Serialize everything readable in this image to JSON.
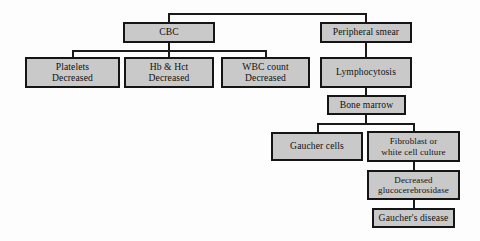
{
  "diagram": {
    "colors": {
      "box_fill": "#c9c9c9",
      "box_border": "#151515",
      "line": "#1a1a1a",
      "background": "#fdfdfd",
      "text": "#111111"
    },
    "nodes": [
      {
        "id": "cbc",
        "lines": [
          "CBC"
        ]
      },
      {
        "id": "peripheral",
        "lines": [
          "Peripheral smear"
        ]
      },
      {
        "id": "platelets",
        "lines": [
          "Platelets",
          "Decreased"
        ]
      },
      {
        "id": "hbhct",
        "lines": [
          "Hb & Hct",
          "Decreased"
        ]
      },
      {
        "id": "wbc",
        "lines": [
          "WBC count",
          "Decreased"
        ]
      },
      {
        "id": "lymphocytosis",
        "lines": [
          "Lymphocytosis"
        ]
      },
      {
        "id": "bonemarrow",
        "lines": [
          "Bone marrow"
        ]
      },
      {
        "id": "gauchercells",
        "lines": [
          "Gaucher cells"
        ]
      },
      {
        "id": "fibroblast",
        "lines": [
          "Fibroblast or",
          "white cell culture"
        ]
      },
      {
        "id": "glucocere",
        "lines": [
          "Decreased",
          "glucocerebrosidase"
        ]
      },
      {
        "id": "disease",
        "lines": [
          "Gaucher's disease"
        ]
      }
    ],
    "labels": {
      "cbc": "CBC",
      "peripheral_smear": "Peripheral smear",
      "platelets_l1": "Platelets",
      "platelets_l2": "Decreased",
      "hbhct_l1": "Hb & Hct",
      "hbhct_l2": "Decreased",
      "wbc_l1": "WBC count",
      "wbc_l2": "Decreased",
      "lymphocytosis": "Lymphocytosis",
      "bone_marrow": "Bone marrow",
      "gaucher_cells": "Gaucher cells",
      "fibroblast_l1": "Fibroblast or",
      "fibroblast_l2": "white cell culture",
      "glucocere_l1": "Decreased",
      "glucocere_l2": "glucocerebrosidase",
      "gauchers_disease": "Gaucher's disease"
    }
  }
}
